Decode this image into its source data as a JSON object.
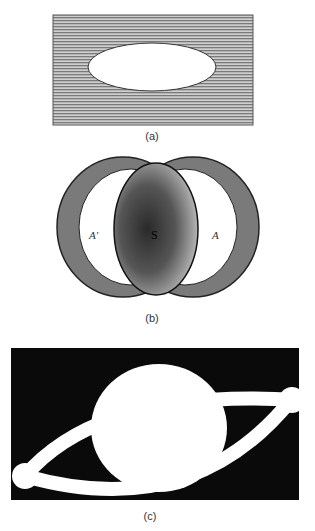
{
  "figure": {
    "panels": [
      {
        "id": "a",
        "caption": "(a)",
        "description": "white ellipse hole in hatched grey plate"
      },
      {
        "id": "b",
        "caption": "(b)",
        "description": "two overlapping ring-shaped lobes with dark central region",
        "labels": {
          "left": "A'",
          "center": "S",
          "right": "A"
        }
      },
      {
        "id": "c",
        "caption": "(c)",
        "description": "white lens-shaped figure with terminal circles on black background"
      }
    ]
  },
  "colors": {
    "hatch": "#8a8a8a",
    "ring": "#6e6e6e",
    "center_dark": "#3a3a3a",
    "black": "#0a0a0a",
    "white": "#ffffff"
  }
}
